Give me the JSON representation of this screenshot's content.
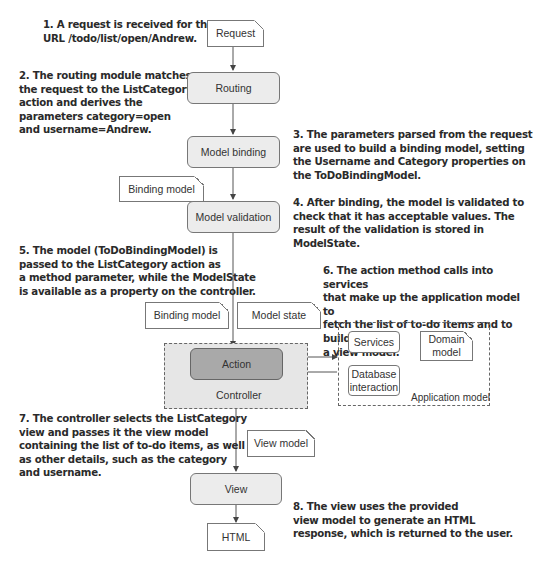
{
  "annotations": [
    {
      "id": 1,
      "lines": [
        "1. A request is received for the",
        "URL /todo/list/open/Andrew."
      ]
    },
    {
      "id": 2,
      "lines": [
        "2. The routing module matches",
        "the request to the ListCategory",
        "action and derives the",
        "parameters category=open",
        "and username=Andrew."
      ]
    },
    {
      "id": 3,
      "lines": [
        "3. The parameters parsed from the request",
        "are used to build a binding model, setting",
        "the Username and Category properties on",
        "the ToDoBindingModel."
      ]
    },
    {
      "id": 4,
      "lines": [
        "4. After binding, the model is validated to",
        "check that it has acceptable values. The",
        "result of the validation is stored in",
        "ModelState."
      ]
    },
    {
      "id": 5,
      "lines": [
        "5. The model (ToDoBindingModel) is",
        "passed to the ListCategory action as",
        "a method parameter, while the ModelState",
        "is available as a property on the controller."
      ]
    },
    {
      "id": 6,
      "lines": [
        "6. The action method calls into services",
        "that make up the application model to",
        "fetch the list of to-do items and to build",
        "a view model."
      ]
    },
    {
      "id": 7,
      "lines": [
        "7. The controller selects the ListCategory",
        "view and passes it the view model",
        "containing the list of to-do items, as well",
        "as other details, such as the category",
        "and username."
      ]
    },
    {
      "id": 8,
      "lines": [
        "8. The view uses the provided",
        "view model to generate an HTML",
        "response, which is returned to the user."
      ]
    }
  ],
  "nodes": {
    "request": "Request",
    "routing": "Routing",
    "model_binding": "Model binding",
    "binding_model_1": "Binding model",
    "model_validation": "Model validation",
    "binding_model_2": "Binding model",
    "model_state": "Model state",
    "action": "Action",
    "controller": "Controller",
    "services": "Services",
    "domain_model": "Domain model",
    "database_interaction": "Database interaction",
    "application_model": "Application model",
    "view_model": "View model",
    "view": "View",
    "html": "HTML"
  },
  "colors": {
    "process_fill": "#ececec",
    "action_fill": "#a9a9a9",
    "controller_fill": "#e6e6e6",
    "stroke": "#777777"
  }
}
